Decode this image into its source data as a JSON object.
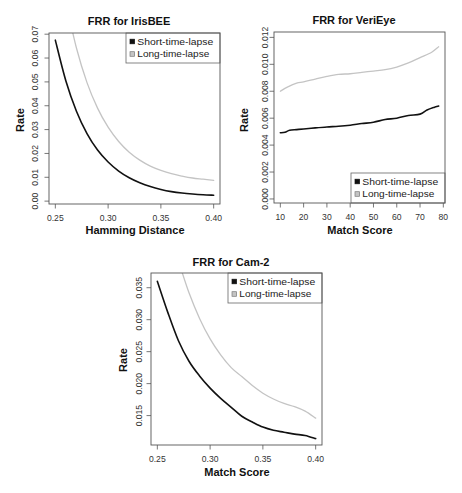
{
  "figure": {
    "background": "#ffffff"
  },
  "colors": {
    "frame": "#555555",
    "text": "#222222",
    "legend_border": "#666666",
    "swatch_border_long": "#7a7a7a"
  },
  "chart_data": [
    {
      "type": "line",
      "title": "FRR for IrisBEE",
      "xlabel": "Hamming Distance",
      "ylabel": "Rate",
      "xlim": [
        0.244,
        0.406
      ],
      "ylim": [
        -0.0012,
        0.0705
      ],
      "grid": false,
      "xticks": [
        {
          "value": 0.25,
          "label": "0.25"
        },
        {
          "value": 0.3,
          "label": "0.30"
        },
        {
          "value": 0.35,
          "label": "0.35"
        },
        {
          "value": 0.4,
          "label": "0.40"
        }
      ],
      "yticks": [
        {
          "value": 0.0,
          "label": "0.00"
        },
        {
          "value": 0.01,
          "label": "0.01"
        },
        {
          "value": 0.02,
          "label": "0.02"
        },
        {
          "value": 0.03,
          "label": "0.03"
        },
        {
          "value": 0.04,
          "label": "0.04"
        },
        {
          "value": 0.05,
          "label": "0.05"
        },
        {
          "value": 0.06,
          "label": "0.06"
        },
        {
          "value": 0.07,
          "label": "0.07"
        }
      ],
      "legend": {
        "position": "top-right",
        "entries": [
          {
            "label": "Short-time-lapse",
            "color": "#111111"
          },
          {
            "label": "Long-time-lapse",
            "color": "#c4c4c4"
          }
        ]
      },
      "series": [
        {
          "name": "Short-time-lapse",
          "color": "#111111",
          "x": [
            0.25,
            0.26,
            0.27,
            0.28,
            0.29,
            0.3,
            0.31,
            0.32,
            0.33,
            0.34,
            0.35,
            0.36,
            0.37,
            0.38,
            0.39,
            0.4
          ],
          "y": [
            0.0675,
            0.0504,
            0.0377,
            0.0283,
            0.0214,
            0.0164,
            0.0126,
            0.0098,
            0.0077,
            0.0061,
            0.0049,
            0.004,
            0.0034,
            0.003,
            0.0027,
            0.0025
          ]
        },
        {
          "name": "Long-time-lapse",
          "color": "#c4c4c4",
          "x": [
            0.26,
            0.27,
            0.28,
            0.29,
            0.3,
            0.31,
            0.32,
            0.33,
            0.34,
            0.35,
            0.36,
            0.37,
            0.38,
            0.39,
            0.4
          ],
          "y": [
            0.0835,
            0.0642,
            0.0497,
            0.039,
            0.031,
            0.025,
            0.0205,
            0.0172,
            0.0147,
            0.0129,
            0.0115,
            0.0105,
            0.0097,
            0.0092,
            0.0087
          ]
        }
      ]
    },
    {
      "type": "line",
      "title": "FRR for VeriEye",
      "xlabel": "Match Score",
      "ylabel": "Rate",
      "xlim": [
        7.28,
        80.72
      ],
      "ylim": [
        -0.0003,
        0.0124
      ],
      "grid": false,
      "xticks": [
        {
          "value": 10,
          "label": "10"
        },
        {
          "value": 20,
          "label": "20"
        },
        {
          "value": 30,
          "label": "30"
        },
        {
          "value": 40,
          "label": "40"
        },
        {
          "value": 50,
          "label": "50"
        },
        {
          "value": 60,
          "label": "60"
        },
        {
          "value": 70,
          "label": "70"
        },
        {
          "value": 80,
          "label": "80"
        }
      ],
      "yticks": [
        {
          "value": 0.0,
          "label": "0.000"
        },
        {
          "value": 0.002,
          "label": "0.002"
        },
        {
          "value": 0.004,
          "label": "0.004"
        },
        {
          "value": 0.006,
          "label": "0.006"
        },
        {
          "value": 0.008,
          "label": "0.008"
        },
        {
          "value": 0.01,
          "label": "0.010"
        },
        {
          "value": 0.012,
          "label": "0.012"
        }
      ],
      "legend": {
        "position": "bottom-right",
        "entries": [
          {
            "label": "Short-time-lapse",
            "color": "#111111"
          },
          {
            "label": "Long-time-lapse",
            "color": "#c4c4c4"
          }
        ]
      },
      "series": [
        {
          "name": "Short-time-lapse",
          "color": "#111111",
          "x": [
            10,
            12,
            14,
            17,
            20,
            25,
            30,
            35,
            40,
            45,
            50,
            55,
            60,
            65,
            70,
            73,
            76,
            78
          ],
          "y": [
            0.00492,
            0.00495,
            0.0051,
            0.00515,
            0.0052,
            0.00528,
            0.00535,
            0.0054,
            0.00548,
            0.0056,
            0.0057,
            0.0059,
            0.006,
            0.0062,
            0.0063,
            0.0066,
            0.0068,
            0.0069
          ]
        },
        {
          "name": "Long-time-lapse",
          "color": "#c4c4c4",
          "x": [
            10,
            13,
            17,
            20,
            25,
            30,
            35,
            40,
            45,
            50,
            55,
            60,
            65,
            70,
            75,
            78
          ],
          "y": [
            0.008,
            0.0083,
            0.0086,
            0.0087,
            0.0089,
            0.0091,
            0.00925,
            0.0093,
            0.0094,
            0.0095,
            0.0096,
            0.0098,
            0.0101,
            0.0105,
            0.0109,
            0.0113
          ]
        }
      ]
    },
    {
      "type": "line",
      "title": "FRR for Cam-2",
      "xlabel": "Match Score",
      "ylabel": "Rate",
      "xlim": [
        0.244,
        0.406
      ],
      "ylim": [
        0.0104,
        0.0373
      ],
      "grid": false,
      "xticks": [
        {
          "value": 0.25,
          "label": "0.25"
        },
        {
          "value": 0.3,
          "label": "0.30"
        },
        {
          "value": 0.35,
          "label": "0.35"
        },
        {
          "value": 0.4,
          "label": "0.40"
        }
      ],
      "yticks": [
        {
          "value": 0.015,
          "label": "0.015"
        },
        {
          "value": 0.02,
          "label": "0.020"
        },
        {
          "value": 0.025,
          "label": "0.025"
        },
        {
          "value": 0.03,
          "label": "0.030"
        },
        {
          "value": 0.035,
          "label": "0.035"
        }
      ],
      "legend": {
        "position": "top-right",
        "entries": [
          {
            "label": "Short-time-lapse",
            "color": "#111111"
          },
          {
            "label": "Long-time-lapse",
            "color": "#c4c4c4"
          }
        ]
      },
      "series": [
        {
          "name": "Short-time-lapse",
          "color": "#111111",
          "x": [
            0.25,
            0.26,
            0.27,
            0.28,
            0.29,
            0.3,
            0.31,
            0.32,
            0.33,
            0.34,
            0.35,
            0.36,
            0.37,
            0.38,
            0.39,
            0.4
          ],
          "y": [
            0.036,
            0.0311,
            0.0267,
            0.0235,
            0.0212,
            0.0193,
            0.0177,
            0.0163,
            0.0149,
            0.014,
            0.0132,
            0.0127,
            0.0124,
            0.0121,
            0.0119,
            0.0114
          ]
        },
        {
          "name": "Long-time-lapse",
          "color": "#c4c4c4",
          "x": [
            0.27,
            0.28,
            0.29,
            0.3,
            0.31,
            0.32,
            0.33,
            0.34,
            0.35,
            0.36,
            0.37,
            0.38,
            0.39,
            0.4
          ],
          "y": [
            0.0392,
            0.0342,
            0.0302,
            0.027,
            0.0245,
            0.0225,
            0.0211,
            0.0197,
            0.0185,
            0.0176,
            0.0169,
            0.0164,
            0.0157,
            0.0146
          ]
        }
      ]
    }
  ]
}
